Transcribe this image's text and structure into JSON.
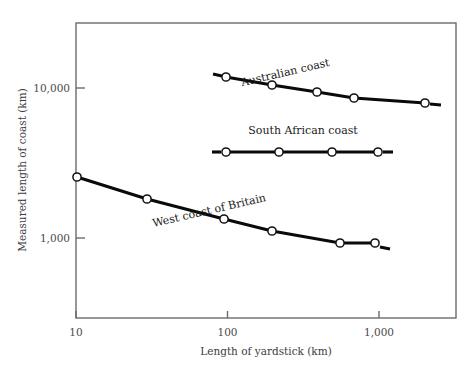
{
  "figure": {
    "background": "#ffffff",
    "ink": "#0a0a0a",
    "axis_color": "#6b6b6b"
  },
  "chart_data": {
    "type": "line",
    "title": "",
    "xlabel": "Length of yardstick   (km)",
    "ylabel": "Measured length of coast   (km)",
    "xscale": "log",
    "yscale": "log",
    "xlim": [
      7.5,
      3000
    ],
    "ylim": [
      430,
      26000
    ],
    "grid": false,
    "legend": "inline-annotations",
    "xticks": [
      10,
      100,
      1000
    ],
    "xticklabels": [
      "10",
      "100",
      "1,000"
    ],
    "yticks": [
      1000,
      10000
    ],
    "yticklabels": [
      "1,000",
      "10,000"
    ],
    "series": [
      {
        "name": "Australian coast",
        "label": "Australian coast",
        "label_rotation": -13,
        "label_x": 286,
        "label_y": 76,
        "marker": "open-circle",
        "x": [
          100,
          200,
          400,
          700,
          1500
        ],
        "y": [
          15000,
          13200,
          11800,
          10700,
          9100
        ],
        "points_px": [
          {
            "x": 226,
            "y": 77
          },
          {
            "x": 272,
            "y": 85
          },
          {
            "x": 317,
            "y": 92
          },
          {
            "x": 354,
            "y": 98
          },
          {
            "x": 425,
            "y": 103
          }
        ],
        "stub_left_px": {
          "x1": 213,
          "y1": 74,
          "x2": 222,
          "y2": 76
        },
        "stub_right_px": {
          "x1": 430,
          "y1": 104,
          "x2": 441,
          "y2": 105
        }
      },
      {
        "name": "South African coast",
        "label": "South African coast",
        "label_rotation": 0,
        "label_x": 303,
        "label_y": 134,
        "marker": "open-circle",
        "x": [
          100,
          220,
          500,
          1000
        ],
        "y": [
          3700,
          3700,
          3680,
          3670
        ],
        "points_px": [
          {
            "x": 226,
            "y": 152
          },
          {
            "x": 279,
            "y": 152
          },
          {
            "x": 332,
            "y": 152
          },
          {
            "x": 378,
            "y": 152
          }
        ],
        "stub_left_px": {
          "x1": 212,
          "y1": 152,
          "x2": 221,
          "y2": 152
        },
        "stub_right_px": {
          "x1": 383,
          "y1": 152,
          "x2": 393,
          "y2": 152
        }
      },
      {
        "name": "West coast of Britain",
        "label": "West coast of Britain",
        "label_rotation": -13,
        "label_x": 210,
        "label_y": 214,
        "marker": "open-circle",
        "x": [
          10,
          32,
          100,
          210,
          550,
          980
        ],
        "y": [
          2800,
          2150,
          1550,
          1230,
          980,
          975
        ],
        "points_px": [
          {
            "x": 77,
            "y": 177
          },
          {
            "x": 147,
            "y": 199
          },
          {
            "x": 224,
            "y": 219
          },
          {
            "x": 272,
            "y": 231
          },
          {
            "x": 340,
            "y": 243
          },
          {
            "x": 375,
            "y": 243
          }
        ],
        "stub_right_px": {
          "x1": 380,
          "y1": 247,
          "x2": 390,
          "y2": 249
        }
      }
    ],
    "annotations": [
      "Richardson coastline-length vs measuring-stick length (log-log)"
    ]
  },
  "axes": {
    "frame": {
      "left": 76,
      "top": 23,
      "right": 456,
      "bottom": 318
    },
    "x_axis_name": "length-of-yardstick-axis",
    "y_axis_name": "measured-length-of-coast-axis"
  }
}
